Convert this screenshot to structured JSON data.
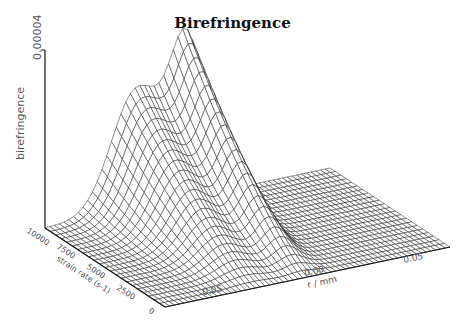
{
  "chart_data": {
    "type": "surface3d",
    "title": "Birefringence",
    "zlabel": "birefringence",
    "xlabel": "r / mm",
    "ylabel": "strain rate (s-1)",
    "z_ticks": [
      "0.00004"
    ],
    "x_ticks": [
      "-0.05",
      "0.00",
      "0.05"
    ],
    "y_ticks": [
      "0",
      "2500",
      "5000",
      "7500",
      "10000"
    ],
    "xlim": [
      -0.085,
      0.085
    ],
    "ylim": [
      0,
      10000
    ],
    "zlim": [
      0,
      4e-05
    ],
    "grid": {
      "nx": 60,
      "ny": 22
    },
    "peaks": [
      {
        "r": -0.03,
        "strain": 10000,
        "height": 2.7e-05,
        "width_r": 0.018
      },
      {
        "r": 0.0,
        "strain": 10000,
        "height": 3.4e-05,
        "width_r": 0.012
      }
    ],
    "style": {
      "line_color": "#222222",
      "axis_color": "#111111"
    }
  }
}
